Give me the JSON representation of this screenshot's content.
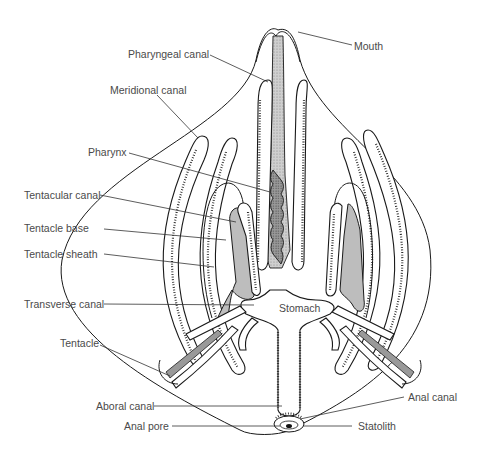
{
  "figure": {
    "labels": {
      "mouth": "Mouth",
      "pharyngeal_canal": "Pharyngeal canal",
      "meridional_canal": "Meridional canal",
      "pharynx": "Pharynx",
      "tentacular_canal": "Tentacular canal",
      "tentacle_base": "Tentacle base",
      "tentacle_sheath": "Tentacle sheath",
      "transverse_canal": "Transverse canal",
      "stomach": "Stomach",
      "tentacle": "Tentacle",
      "aboral_canal": "Aboral canal",
      "anal_pore": "Anal pore",
      "anal_canal": "Anal canal",
      "statolith": "Statolith"
    }
  }
}
